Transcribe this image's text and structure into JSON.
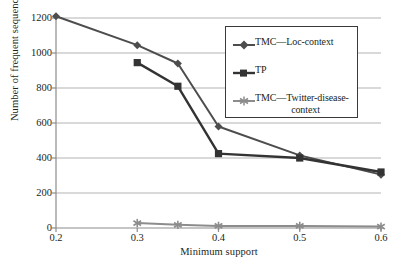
{
  "chart_data": {
    "type": "line",
    "title": "",
    "xlabel": "Minimum support",
    "ylabel": "Number of frequent sequence",
    "xlim": [
      0.2,
      0.6
    ],
    "ylim": [
      0,
      1200
    ],
    "xticks": [
      "0.2",
      "0.3",
      "0.4",
      "0.5",
      "0.6"
    ],
    "xtick_values": [
      0.2,
      0.3,
      0.4,
      0.5,
      0.6
    ],
    "yticks": [
      "0",
      "200",
      "400",
      "600",
      "800",
      "1000",
      "1200"
    ],
    "ytick_values": [
      0,
      200,
      400,
      600,
      800,
      1000,
      1200
    ],
    "grid": "horizontal",
    "legend_position": "upper-right-inside",
    "series": [
      {
        "name": "TMC—Loc-context",
        "marker": "diamond",
        "color": "#4d4d4d",
        "x": [
          0.2,
          0.3,
          0.35,
          0.4,
          0.5,
          0.6
        ],
        "values": [
          1210,
          1045,
          940,
          580,
          415,
          305
        ]
      },
      {
        "name": "TP",
        "marker": "square",
        "color": "#333333",
        "x": [
          0.3,
          0.35,
          0.4,
          0.5,
          0.6
        ],
        "values": [
          945,
          810,
          425,
          400,
          320
        ]
      },
      {
        "name": "TMC—Twitter-disease-context",
        "marker": "asterisk",
        "color": "#8c8c8c",
        "x": [
          0.3,
          0.35,
          0.4,
          0.5,
          0.6
        ],
        "values": [
          28,
          18,
          12,
          12,
          8
        ]
      }
    ]
  },
  "legend": {
    "items": [
      {
        "label": "TMC—Loc-context",
        "marker": "diamond-marker-icon"
      },
      {
        "label": "TP",
        "marker": "square-marker-icon"
      },
      {
        "label_line1": "TMC—Twitter-disease-",
        "label_line2": "context",
        "marker": "asterisk-marker-icon"
      }
    ]
  },
  "colors": {
    "series1": "#4d4d4d",
    "series2": "#333333",
    "series3": "#8c8c8c",
    "grid": "#b3b3b3",
    "axis": "#8c8c8c",
    "text": "#231f20"
  }
}
